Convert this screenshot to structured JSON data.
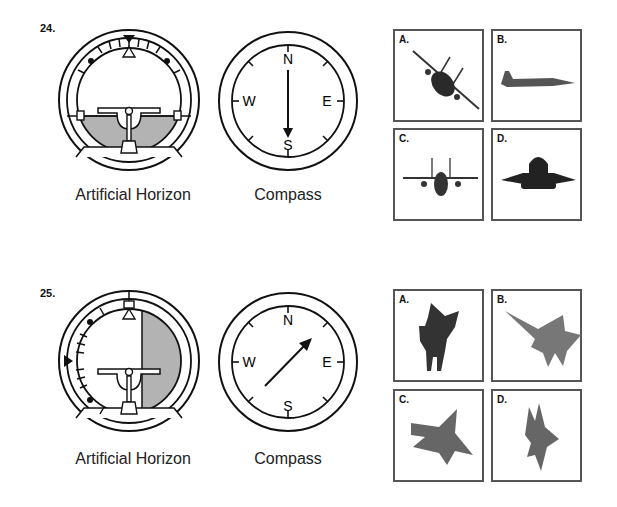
{
  "questions": [
    {
      "number": "24.",
      "horizon_label": "Artificial Horizon",
      "compass_label": "Compass",
      "compass": {
        "N": "N",
        "E": "E",
        "S": "S",
        "W": "W",
        "heading": "South"
      },
      "horizon": {
        "bank": "none",
        "pitch": "level"
      },
      "choices": [
        {
          "letter": "A.",
          "description": "jet banking, nose toward viewer"
        },
        {
          "letter": "B.",
          "description": "jet side view, level"
        },
        {
          "letter": "C.",
          "description": "jet front view, level"
        },
        {
          "letter": "D.",
          "description": "jet rear view, level"
        }
      ]
    },
    {
      "number": "25.",
      "horizon_label": "Artificial Horizon",
      "compass_label": "Compass",
      "compass": {
        "N": "N",
        "E": "E",
        "S": "S",
        "W": "W",
        "heading": "Northeast"
      },
      "horizon": {
        "bank": "90 degrees",
        "pitch": "level"
      },
      "choices": [
        {
          "letter": "A.",
          "description": "jet top view, steep bank"
        },
        {
          "letter": "B.",
          "description": "jet top view, heading northwest"
        },
        {
          "letter": "C.",
          "description": "jet top view, heading northeast"
        },
        {
          "letter": "D.",
          "description": "jet top view, vertical climb"
        }
      ]
    }
  ]
}
